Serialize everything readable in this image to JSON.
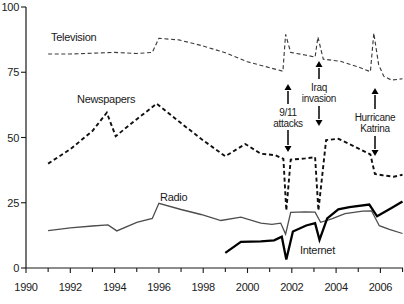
{
  "page": {
    "background": "#ffffff",
    "text_color": "#1a1a1a"
  },
  "chart_data": {
    "type": "line",
    "title": "",
    "xlabel": "",
    "ylabel": "",
    "grid": false,
    "legend": "inline-labels-next-to-lines",
    "x_axis": {
      "range": [
        1990,
        2007.1
      ],
      "minor_tick_every_years": 1,
      "labeled_tick_years": [
        1990,
        1992,
        1994,
        1996,
        1998,
        2000,
        2002,
        2004,
        2006
      ],
      "labels": [
        "1990",
        "1992",
        "1994",
        "1996",
        "1998",
        "2000",
        "2002",
        "2004",
        "2006"
      ]
    },
    "y_axis": {
      "range": [
        0,
        100
      ],
      "ticks": [
        0,
        25,
        50,
        75,
        100
      ],
      "labels": [
        "0",
        "25",
        "50",
        "75",
        "100"
      ]
    },
    "series": [
      {
        "name": "Television",
        "label": "Television",
        "line_style": "dashed",
        "weight": "light",
        "color": "#3c3c3c",
        "stroke_width": 1.15,
        "dash": "4 2.6",
        "points": [
          [
            1991,
            82
          ],
          [
            1992,
            82
          ],
          [
            1993,
            82.3
          ],
          [
            1994,
            82.6
          ],
          [
            1995,
            82.2
          ],
          [
            1995.7,
            82.6
          ],
          [
            1996,
            88
          ],
          [
            1996.9,
            87.4
          ],
          [
            1997.9,
            85.3
          ],
          [
            1999,
            82.5
          ],
          [
            2000,
            79
          ],
          [
            2000.8,
            77.2
          ],
          [
            2001.6,
            75.4
          ],
          [
            2001.72,
            89.5
          ],
          [
            2001.95,
            82.6
          ],
          [
            2002.6,
            81.6
          ],
          [
            2003.05,
            80.8
          ],
          [
            2003.18,
            88.5
          ],
          [
            2003.42,
            80
          ],
          [
            2004.2,
            79.2
          ],
          [
            2005,
            77
          ],
          [
            2005.55,
            75.2
          ],
          [
            2005.7,
            90
          ],
          [
            2005.92,
            78
          ],
          [
            2006.15,
            73.5
          ],
          [
            2006.5,
            72
          ],
          [
            2007,
            72.5
          ]
        ]
      },
      {
        "name": "Newspapers",
        "label": "Newspapers",
        "line_style": "dashed",
        "weight": "bold",
        "color": "#101010",
        "stroke_width": 1.9,
        "dash": "4 2.8",
        "points": [
          [
            1991,
            40
          ],
          [
            1992,
            45.5
          ],
          [
            1993,
            52.5
          ],
          [
            1993.65,
            59.5
          ],
          [
            1994.05,
            50.5
          ],
          [
            1995,
            57
          ],
          [
            1995.9,
            63
          ],
          [
            1997,
            55.5
          ],
          [
            1997.9,
            49.5
          ],
          [
            1999,
            42.8
          ],
          [
            1999.9,
            47.5
          ],
          [
            2000.6,
            43.8
          ],
          [
            2001.25,
            43.2
          ],
          [
            2001.62,
            41.8
          ],
          [
            2001.75,
            22
          ],
          [
            2001.95,
            41.5
          ],
          [
            2002.6,
            42
          ],
          [
            2003.05,
            42.5
          ],
          [
            2003.2,
            22
          ],
          [
            2003.55,
            49
          ],
          [
            2004.1,
            49.5
          ],
          [
            2004.6,
            47.5
          ],
          [
            2005.2,
            45
          ],
          [
            2005.55,
            43.5
          ],
          [
            2005.75,
            36
          ],
          [
            2006.1,
            35.5
          ],
          [
            2006.6,
            35
          ],
          [
            2007,
            35.7
          ]
        ]
      },
      {
        "name": "Radio",
        "label": "Radio",
        "line_style": "solid",
        "weight": "light",
        "color": "#4d4d4d",
        "stroke_width": 1.3,
        "dash": "",
        "points": [
          [
            1991,
            14.3
          ],
          [
            1992,
            15.4
          ],
          [
            1993,
            16.1
          ],
          [
            1993.7,
            16.5
          ],
          [
            1994.1,
            14.2
          ],
          [
            1995,
            17.5
          ],
          [
            1995.7,
            19
          ],
          [
            1996,
            24.8
          ],
          [
            1997,
            22.4
          ],
          [
            1997.9,
            20.5
          ],
          [
            1998.8,
            18.2
          ],
          [
            1999.7,
            19.5
          ],
          [
            2000.6,
            17.2
          ],
          [
            2001.1,
            16.7
          ],
          [
            2001.5,
            17.2
          ],
          [
            2001.72,
            13
          ],
          [
            2001.95,
            21.3
          ],
          [
            2002.6,
            21.5
          ],
          [
            2003.05,
            21.4
          ],
          [
            2003.3,
            17.5
          ],
          [
            2003.8,
            18.8
          ],
          [
            2004.4,
            20.8
          ],
          [
            2005.2,
            21.8
          ],
          [
            2005.6,
            21.9
          ],
          [
            2005.95,
            16.2
          ],
          [
            2006.4,
            14.8
          ],
          [
            2007,
            13.2
          ]
        ]
      },
      {
        "name": "Internet",
        "label": "Internet",
        "line_style": "solid",
        "weight": "bold",
        "color": "#000000",
        "stroke_width": 2.3,
        "dash": "",
        "points": [
          [
            1999,
            5.8
          ],
          [
            1999.7,
            10
          ],
          [
            2000.6,
            10.2
          ],
          [
            2001.2,
            10.6
          ],
          [
            2001.55,
            12
          ],
          [
            2001.75,
            3.2
          ],
          [
            2002.05,
            14
          ],
          [
            2002.65,
            16.3
          ],
          [
            2003.05,
            17.2
          ],
          [
            2003.25,
            10.8
          ],
          [
            2003.6,
            19
          ],
          [
            2004.1,
            22.5
          ],
          [
            2004.6,
            23.3
          ],
          [
            2005.5,
            24.3
          ],
          [
            2005.85,
            19.8
          ],
          [
            2006.5,
            23
          ],
          [
            2007,
            25.5
          ]
        ]
      }
    ],
    "annotations": [
      {
        "label": "9/11 attacks",
        "lines": [
          "9/11",
          "attacks"
        ],
        "x_year": 2001.75,
        "arrow_up": true,
        "arrow_down": true
      },
      {
        "label": "Iraq invasion",
        "lines": [
          "Iraq",
          "invasion"
        ],
        "x_year": 2003.2,
        "arrow_up": true,
        "arrow_down": true
      },
      {
        "label": "Hurricane Katrina",
        "lines": [
          "Hurricane",
          "Katrina"
        ],
        "x_year": 2005.7,
        "arrow_up": true,
        "arrow_down": true
      }
    ]
  }
}
